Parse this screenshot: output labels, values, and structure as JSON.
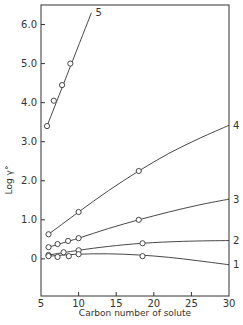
{
  "chart_data": {
    "type": "line",
    "title": "",
    "xlabel": "Carbon number of solute",
    "ylabel": "Log γ°",
    "xlim": [
      5,
      30
    ],
    "ylim": [
      -0.95,
      6.5
    ],
    "x_ticks": [
      5,
      10,
      15,
      20,
      25,
      30
    ],
    "x_tick_labels": [
      "5",
      "10",
      "15",
      "20",
      "25",
      "30"
    ],
    "y_ticks": [
      0,
      1.0,
      2.0,
      3.0,
      4.0,
      5.0,
      6.0
    ],
    "y_tick_labels": [
      "0",
      "1.0",
      "2.0",
      "3.0",
      "4.0",
      "5.0",
      "6.0"
    ],
    "grid": false,
    "legend": "curve labels at line ends",
    "series": [
      {
        "name": "5",
        "points": [
          [
            5.8,
            3.4
          ],
          [
            6.7,
            4.05
          ],
          [
            7.8,
            4.45
          ],
          [
            8.9,
            5.0
          ]
        ],
        "curve": [
          [
            5.8,
            3.4
          ],
          [
            11.7,
            6.3
          ]
        ]
      },
      {
        "name": "4",
        "points": [
          [
            6,
            0.63
          ],
          [
            10,
            1.2
          ],
          [
            18,
            2.25
          ]
        ],
        "curve": [
          [
            6,
            0.63
          ],
          [
            10,
            1.2
          ],
          [
            14,
            1.75
          ],
          [
            18,
            2.25
          ],
          [
            22,
            2.7
          ],
          [
            26,
            3.08
          ],
          [
            30,
            3.42
          ]
        ]
      },
      {
        "name": "3",
        "points": [
          [
            6,
            0.3
          ],
          [
            7.2,
            0.38
          ],
          [
            8.6,
            0.46
          ],
          [
            10,
            0.53
          ],
          [
            18,
            1.0
          ]
        ],
        "curve": [
          [
            6,
            0.3
          ],
          [
            10,
            0.53
          ],
          [
            14,
            0.78
          ],
          [
            18,
            1.0
          ],
          [
            22,
            1.2
          ],
          [
            26,
            1.38
          ],
          [
            30,
            1.53
          ]
        ]
      },
      {
        "name": "2",
        "points": [
          [
            6,
            0.1
          ],
          [
            8,
            0.17
          ],
          [
            10,
            0.22
          ],
          [
            18.5,
            0.4
          ]
        ],
        "curve": [
          [
            6,
            0.1
          ],
          [
            10,
            0.22
          ],
          [
            14,
            0.32
          ],
          [
            18.5,
            0.4
          ],
          [
            24,
            0.45
          ],
          [
            30,
            0.47
          ]
        ]
      },
      {
        "name": "1",
        "points": [
          [
            6,
            0.07
          ],
          [
            7.2,
            0.05
          ],
          [
            8.7,
            0.07
          ],
          [
            10,
            0.12
          ],
          [
            18.5,
            0.07
          ]
        ],
        "curve": [
          [
            6,
            0.07
          ],
          [
            10,
            0.12
          ],
          [
            14,
            0.13
          ],
          [
            18,
            0.1
          ],
          [
            22,
            0.04
          ],
          [
            26,
            -0.05
          ],
          [
            30,
            -0.15
          ]
        ]
      }
    ]
  }
}
